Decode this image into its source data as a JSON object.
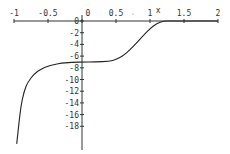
{
  "chart_data": {
    "type": "line",
    "title": "",
    "xlabel": "x",
    "ylabel": "",
    "xlim": [
      -1,
      2
    ],
    "ylim": [
      -20,
      0
    ],
    "grid": false,
    "x_ticks": [
      "-1",
      "-0.5",
      "0",
      "0.5",
      "1",
      "1.5",
      "2"
    ],
    "y_ticks": [
      "0",
      "-2",
      "-4",
      "-6",
      "-8",
      "-10",
      "-12",
      "-14",
      "-16",
      "-18"
    ],
    "series": [
      {
        "name": "f(x)",
        "x": [
          -0.96,
          -0.9,
          -0.85,
          -0.8,
          -0.7,
          -0.6,
          -0.5,
          -0.4,
          -0.3,
          -0.2,
          -0.1,
          0,
          0.2,
          0.4,
          0.5,
          0.6,
          0.7,
          0.8,
          0.9,
          1.0,
          1.1,
          1.2,
          1.3,
          1.5,
          2.0
        ],
        "y": [
          -21,
          -14.5,
          -12,
          -10.5,
          -9,
          -8.2,
          -7.7,
          -7.4,
          -7.2,
          -7.1,
          -7.05,
          -7,
          -7,
          -6.9,
          -6.6,
          -6.0,
          -5.0,
          -3.8,
          -2.5,
          -1.3,
          -0.4,
          0,
          0,
          0,
          0
        ]
      }
    ]
  },
  "axis": {
    "x_label": "x"
  }
}
